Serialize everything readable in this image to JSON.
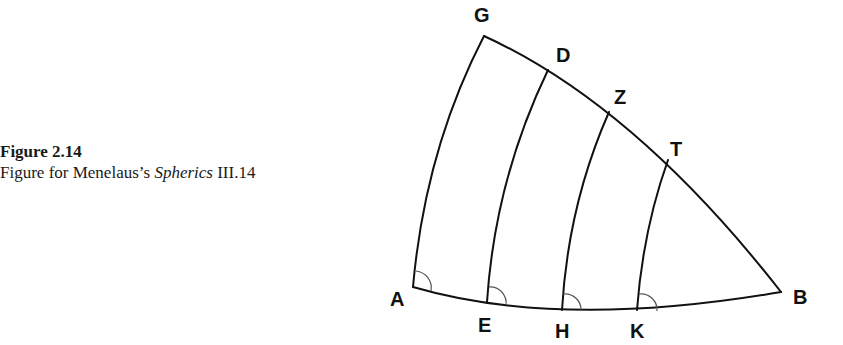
{
  "caption": {
    "figure_number": "Figure 2.14",
    "text_prefix": "Figure for Menelaus’s ",
    "text_italic": "Spherics",
    "text_suffix": " III.14"
  },
  "diagram": {
    "points": {
      "G": {
        "label": "G",
        "x": 484,
        "y": 36,
        "lx": 474,
        "ly": 22
      },
      "D": {
        "label": "D",
        "x": 548,
        "y": 70,
        "lx": 556,
        "ly": 62
      },
      "Z": {
        "label": "Z",
        "x": 609,
        "y": 112,
        "lx": 614,
        "ly": 104
      },
      "T": {
        "label": "T",
        "x": 668,
        "y": 160,
        "lx": 670,
        "ly": 156
      },
      "B": {
        "label": "B",
        "x": 781,
        "y": 292,
        "lx": 793,
        "ly": 304
      },
      "A": {
        "label": "A",
        "x": 413,
        "y": 287,
        "lx": 390,
        "ly": 306
      },
      "E": {
        "label": "E",
        "x": 487,
        "y": 302,
        "lx": 478,
        "ly": 332
      },
      "H": {
        "label": "H",
        "x": 562,
        "y": 310,
        "lx": 555,
        "ly": 338
      },
      "K": {
        "label": "K",
        "x": 637,
        "y": 310,
        "lx": 630,
        "ly": 338
      }
    },
    "arcs": [
      "GB",
      "AB",
      "GA",
      "DE",
      "ZH",
      "TK"
    ],
    "angle_markers": [
      "A",
      "E",
      "H",
      "K"
    ]
  }
}
